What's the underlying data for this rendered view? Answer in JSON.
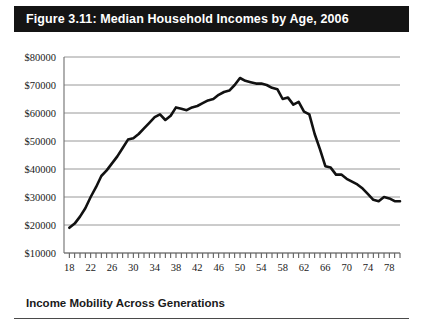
{
  "figure": {
    "title": "Figure 3.11: Median Household Incomes by Age, 2006",
    "caption": "Income Mobility Across Generations",
    "title_bar_color": "#141414",
    "title_text_color": "#ffffff",
    "line_color": "#111111",
    "grid_color": "#8c8c8c",
    "axis_color": "#6e6e6e"
  },
  "chart_data": {
    "type": "line",
    "title": "Figure 3.11: Median Household Incomes by Age, 2006",
    "xlabel": "",
    "ylabel": "",
    "xlim": [
      17,
      80
    ],
    "ylim": [
      10000,
      80000
    ],
    "grid": true,
    "legend": "none",
    "ytick_labels": [
      "$80000",
      "$70000",
      "$60000",
      "$50000",
      "$40000",
      "$30000",
      "$20000",
      "$10000"
    ],
    "ytick_values": [
      80000,
      70000,
      60000,
      50000,
      40000,
      30000,
      20000,
      10000
    ],
    "xtick_labels": [
      "18",
      "22",
      "26",
      "30",
      "34",
      "38",
      "42",
      "46",
      "50",
      "54",
      "58",
      "62",
      "66",
      "70",
      "74",
      "78"
    ],
    "xtick_values": [
      18,
      22,
      26,
      30,
      34,
      38,
      42,
      46,
      50,
      54,
      58,
      62,
      66,
      70,
      74,
      78
    ],
    "xtick_minor_step": 1,
    "x": [
      18,
      19,
      20,
      21,
      22,
      23,
      24,
      25,
      26,
      27,
      28,
      29,
      30,
      31,
      32,
      33,
      34,
      35,
      36,
      37,
      38,
      39,
      40,
      41,
      42,
      43,
      44,
      45,
      46,
      47,
      48,
      49,
      50,
      51,
      52,
      53,
      54,
      55,
      56,
      57,
      58,
      59,
      60,
      61,
      62,
      63,
      64,
      65,
      66,
      67,
      68,
      69,
      70,
      71,
      72,
      73,
      74,
      75,
      76,
      77,
      78,
      79,
      80
    ],
    "y": [
      19000,
      20500,
      23000,
      26000,
      30000,
      33500,
      37500,
      39500,
      42000,
      44500,
      47500,
      50500,
      51000,
      52500,
      54500,
      56500,
      58500,
      59500,
      57500,
      59000,
      62000,
      61500,
      61000,
      62000,
      62500,
      63500,
      64500,
      65000,
      66500,
      67500,
      68000,
      70000,
      72500,
      71500,
      71000,
      70500,
      70500,
      70000,
      69000,
      68500,
      65000,
      65500,
      63000,
      64000,
      60500,
      59500,
      52500,
      47000,
      41000,
      40500,
      38000,
      38000,
      36500,
      35500,
      34500,
      33000,
      31000,
      29000,
      28500,
      30000,
      29500,
      28500,
      28500
    ],
    "series_name": "Median household income"
  }
}
